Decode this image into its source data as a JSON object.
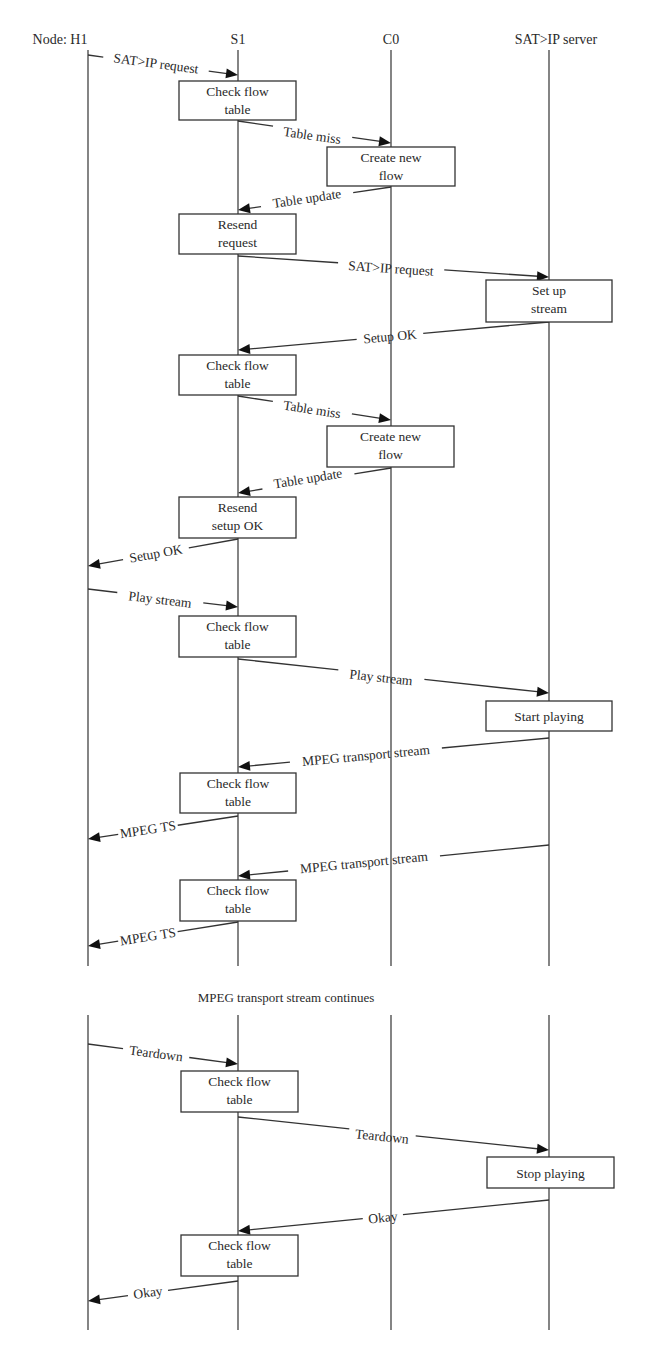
{
  "diagram": {
    "nodes": [
      {
        "id": "H1",
        "label": "Node: H1",
        "x": 88,
        "label_x": 60
      },
      {
        "id": "S1",
        "label": "S1",
        "x": 238,
        "label_x": 238
      },
      {
        "id": "C0",
        "label": "C0",
        "x": 391,
        "label_x": 391
      },
      {
        "id": "SRV",
        "label": "SAT>IP server",
        "x": 549,
        "label_x": 556
      }
    ],
    "label_y": 44,
    "segments": [
      {
        "y1": 50,
        "y2": 966
      },
      {
        "y1": 1015,
        "y2": 1330
      }
    ],
    "boxes": [
      {
        "node": "S1",
        "lines": [
          "Check flow",
          "table"
        ],
        "x": 179,
        "y": 81,
        "w": 117,
        "h": 39
      },
      {
        "node": "C0",
        "lines": [
          "Create new",
          "flow"
        ],
        "x": 327,
        "y": 147,
        "w": 128,
        "h": 39
      },
      {
        "node": "S1",
        "lines": [
          "Resend",
          "request"
        ],
        "x": 179,
        "y": 214,
        "w": 117,
        "h": 40
      },
      {
        "node": "SRV",
        "lines": [
          "Set up",
          "stream"
        ],
        "x": 486,
        "y": 280,
        "w": 126,
        "h": 42
      },
      {
        "node": "S1",
        "lines": [
          "Check flow",
          "table"
        ],
        "x": 179,
        "y": 355,
        "w": 117,
        "h": 40
      },
      {
        "node": "C0",
        "lines": [
          "Create new",
          "flow"
        ],
        "x": 327,
        "y": 426,
        "w": 127,
        "h": 41
      },
      {
        "node": "S1",
        "lines": [
          "Resend",
          "setup OK"
        ],
        "x": 179,
        "y": 497,
        "w": 117,
        "h": 41
      },
      {
        "node": "S1",
        "lines": [
          "Check flow",
          "table"
        ],
        "x": 179,
        "y": 616,
        "w": 117,
        "h": 41
      },
      {
        "node": "SRV",
        "lines": [
          "Start playing"
        ],
        "x": 486,
        "y": 701,
        "w": 126,
        "h": 30
      },
      {
        "node": "S1",
        "lines": [
          "Check flow",
          "table"
        ],
        "x": 180,
        "y": 773,
        "w": 116,
        "h": 40
      },
      {
        "node": "S1",
        "lines": [
          "Check flow",
          "table"
        ],
        "x": 180,
        "y": 880,
        "w": 116,
        "h": 41
      },
      {
        "node": "S1",
        "lines": [
          "Check flow",
          "table"
        ],
        "x": 181,
        "y": 1071,
        "w": 117,
        "h": 41
      },
      {
        "node": "SRV",
        "lines": [
          "Stop playing"
        ],
        "x": 487,
        "y": 1157,
        "w": 127,
        "h": 31
      },
      {
        "node": "S1",
        "lines": [
          "Check flow",
          "table"
        ],
        "x": 181,
        "y": 1235,
        "w": 117,
        "h": 41
      }
    ],
    "messages": [
      {
        "label": "SAT>IP request",
        "from": "H1",
        "to": "S1",
        "x1": 88,
        "y1": 55,
        "x2": 238,
        "y2": 75,
        "lx": 156,
        "ly": 68
      },
      {
        "label": "Table miss",
        "from": "S1",
        "to": "C0",
        "x1": 238,
        "y1": 121,
        "x2": 391,
        "y2": 143,
        "lx": 312,
        "ly": 140
      },
      {
        "label": "Table update",
        "from": "C0",
        "to": "S1",
        "x1": 391,
        "y1": 187,
        "x2": 238,
        "y2": 210,
        "lx": 307,
        "ly": 203
      },
      {
        "label": "SAT>IP request",
        "from": "S1",
        "to": "SRV",
        "x1": 238,
        "y1": 256,
        "x2": 549,
        "y2": 277,
        "lx": 391,
        "ly": 273
      },
      {
        "label": "Setup OK",
        "from": "SRV",
        "to": "S1",
        "x1": 549,
        "y1": 322,
        "x2": 238,
        "y2": 350,
        "lx": 390,
        "ly": 341
      },
      {
        "label": "Table miss",
        "from": "S1",
        "to": "C0",
        "x1": 238,
        "y1": 396,
        "x2": 391,
        "y2": 420,
        "lx": 312,
        "ly": 414
      },
      {
        "label": "Table update",
        "from": "C0",
        "to": "S1",
        "x1": 391,
        "y1": 468,
        "x2": 238,
        "y2": 493,
        "lx": 308,
        "ly": 483
      },
      {
        "label": "Setup OK",
        "from": "S1",
        "to": "H1",
        "x1": 238,
        "y1": 539,
        "x2": 88,
        "y2": 566,
        "lx": 156,
        "ly": 558
      },
      {
        "label": "Play stream",
        "from": "H1",
        "to": "S1",
        "x1": 88,
        "y1": 589,
        "x2": 238,
        "y2": 607,
        "lx": 160,
        "ly": 604
      },
      {
        "label": "Play stream",
        "from": "S1",
        "to": "SRV",
        "x1": 238,
        "y1": 659,
        "x2": 549,
        "y2": 693,
        "lx": 381,
        "ly": 682
      },
      {
        "label": "MPEG transport stream",
        "from": "SRV",
        "to": "S1",
        "x1": 549,
        "y1": 738,
        "x2": 238,
        "y2": 767,
        "lx": 366,
        "ly": 760
      },
      {
        "label": "MPEG TS",
        "from": "S1",
        "to": "H1",
        "x1": 238,
        "y1": 816,
        "x2": 88,
        "y2": 839,
        "lx": 148,
        "ly": 834
      },
      {
        "label": "MPEG transport stream",
        "from": "SRV",
        "to": "S1",
        "x1": 549,
        "y1": 845,
        "x2": 238,
        "y2": 876,
        "lx": 364,
        "ly": 867
      },
      {
        "label": "MPEG TS",
        "from": "S1",
        "to": "H1",
        "x1": 238,
        "y1": 922,
        "x2": 88,
        "y2": 946,
        "lx": 148,
        "ly": 941
      },
      {
        "label": "Teardown",
        "from": "H1",
        "to": "S1",
        "x1": 88,
        "y1": 1044,
        "x2": 238,
        "y2": 1064,
        "lx": 156,
        "ly": 1058
      },
      {
        "label": "Teardown",
        "from": "S1",
        "to": "SRV",
        "x1": 238,
        "y1": 1117,
        "x2": 549,
        "y2": 1150,
        "lx": 382,
        "ly": 1141
      },
      {
        "label": "Okay",
        "from": "SRV",
        "to": "S1",
        "x1": 549,
        "y1": 1200,
        "x2": 238,
        "y2": 1231,
        "lx": 383,
        "ly": 1222
      },
      {
        "label": "Okay",
        "from": "S1",
        "to": "H1",
        "x1": 238,
        "y1": 1281,
        "x2": 88,
        "y2": 1301,
        "lx": 148,
        "ly": 1297
      }
    ],
    "continuation_note": {
      "text": "MPEG transport stream continues",
      "x": 286,
      "y": 1002
    }
  }
}
